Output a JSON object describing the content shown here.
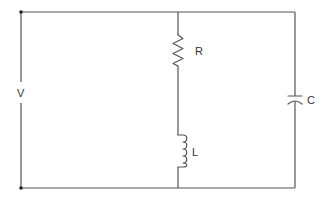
{
  "diagram": {
    "type": "circuit-schematic",
    "colors": {
      "wire": "#555555",
      "label": "#333333",
      "background": "#ffffff"
    },
    "components": {
      "source": {
        "label": "V",
        "kind": "voltage-source"
      },
      "resistor": {
        "label": "R",
        "kind": "resistor"
      },
      "inductor": {
        "label": "L",
        "kind": "inductor"
      },
      "capacitor": {
        "label": "C",
        "kind": "capacitor"
      }
    }
  }
}
